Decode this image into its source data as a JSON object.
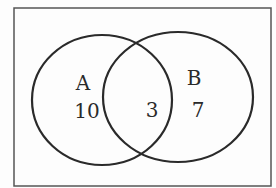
{
  "diagram": {
    "type": "venn",
    "universe": {
      "x": 14,
      "y": 8,
      "width": 257,
      "height": 178,
      "stroke": "#555555"
    },
    "sets": [
      {
        "name": "A",
        "only_count": "10",
        "cx": 102,
        "cy": 100,
        "rx": 70,
        "ry": 65,
        "label_pos": {
          "x": 83,
          "y": 90
        },
        "count_pos": {
          "x": 87,
          "y": 118
        }
      },
      {
        "name": "B",
        "only_count": "7",
        "cx": 178,
        "cy": 97,
        "rx": 75,
        "ry": 65,
        "label_pos": {
          "x": 194,
          "y": 85
        },
        "count_pos": {
          "x": 198,
          "y": 117
        }
      }
    ],
    "intersection": {
      "sets": [
        "A",
        "B"
      ],
      "count": "3",
      "count_pos": {
        "x": 152,
        "y": 117
      }
    },
    "colors": {
      "circle_stroke": "#2a2a2a",
      "text": "#2a2a2a",
      "background": "#fdfdfd"
    }
  }
}
